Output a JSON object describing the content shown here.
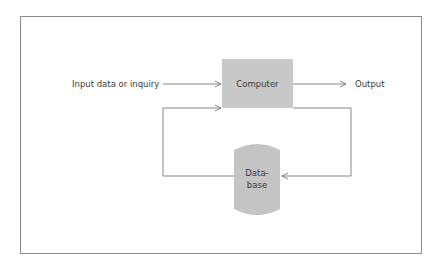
{
  "diagram": {
    "nodes": {
      "input": {
        "label": "Input data or inquiry"
      },
      "computer": {
        "label": "Computer",
        "fill": "#c8c8c8"
      },
      "output": {
        "label": "Output"
      },
      "database": {
        "label_line1": "Data-",
        "label_line2": "base",
        "fill": "#c4c4c4"
      }
    },
    "edges": [
      {
        "from": "input",
        "to": "computer"
      },
      {
        "from": "computer",
        "to": "output"
      },
      {
        "from": "computer",
        "to": "database",
        "route": "right loop"
      },
      {
        "from": "database",
        "to": "computer",
        "route": "left loop"
      }
    ],
    "line_color": "#6a6a6a"
  }
}
